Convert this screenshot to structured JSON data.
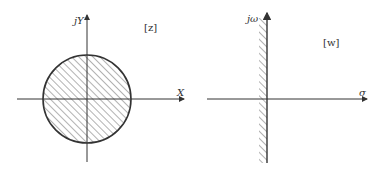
{
  "diagram": {
    "left_plane": {
      "plane_label": "[z]",
      "horizontal_axis_label": "X",
      "vertical_axis_label": "jY",
      "region": "unit-circle-interior",
      "region_style": "hatched"
    },
    "right_plane": {
      "plane_label": "[w]",
      "horizontal_axis_label": "σ",
      "vertical_axis_label": "jω",
      "region": "left-half-plane",
      "region_style": "hatched-along-imaginary-axis"
    },
    "colors": {
      "stroke": "#333333",
      "hatch": "#555555",
      "background": "#ffffff"
    }
  }
}
